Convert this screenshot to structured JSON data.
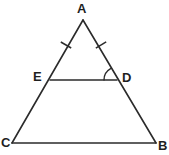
{
  "figure": {
    "background_color": "#ffffff",
    "stroke_color": "#2b2b2b",
    "canvas": {
      "width": 169,
      "height": 155
    }
  },
  "labels": {
    "apex": "A",
    "bottom_right": "B",
    "bottom_left": "C",
    "right_mid": "D",
    "left_mid": "E"
  },
  "points": {
    "A": {
      "x": 83,
      "y": 20
    },
    "B": {
      "x": 156,
      "y": 143
    },
    "C": {
      "x": 12,
      "y": 143
    },
    "D": {
      "x": 117,
      "y": 80
    },
    "E": {
      "x": 50,
      "y": 80
    }
  },
  "segments": [
    {
      "name": "side-AC",
      "from": "A",
      "to": "C"
    },
    {
      "name": "side-AB",
      "from": "A",
      "to": "B"
    },
    {
      "name": "base-CB",
      "from": "C",
      "to": "B"
    },
    {
      "name": "segment-ED",
      "from": "E",
      "to": "D"
    }
  ],
  "tick_marks": [
    {
      "name": "tick-AE",
      "on": "side-AC",
      "x": 66,
      "y": 45,
      "count": 1
    },
    {
      "name": "tick-AD",
      "on": "side-AB",
      "x": 101,
      "y": 45,
      "count": 1
    }
  ],
  "angle_marks": [
    {
      "name": "angle-ADE",
      "at": "D",
      "radius": 13
    }
  ]
}
